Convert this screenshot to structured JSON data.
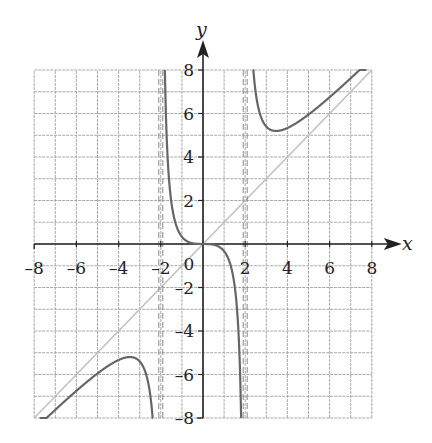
{
  "chart_data": {
    "type": "line",
    "title": "",
    "xlabel": "x",
    "ylabel": "y",
    "xlim": [
      -8,
      8
    ],
    "ylim": [
      -8,
      8
    ],
    "grid": true,
    "grid_step": 1,
    "x_ticks": [
      "-8",
      "-6",
      "-4",
      "-2",
      "0",
      "2",
      "4",
      "6",
      "8"
    ],
    "y_ticks": [
      "8",
      "6",
      "4",
      "2",
      "-2",
      "-4",
      "-6",
      "-8"
    ],
    "origin_label": "0",
    "series": [
      {
        "name": "f(x) = x^3/(x^2-4)",
        "style": "solid",
        "color": "#666666",
        "branches": [
          {
            "x": [
              -8,
              -6,
              -5,
              -4,
              -3.46,
              -3,
              -2.5,
              -2.2,
              -2.1
            ],
            "y": [
              -8.53,
              -6.75,
              -5.95,
              -5.33,
              -5.2,
              -5.4,
              -6.94,
              -12.68,
              -22.6
            ]
          },
          {
            "x": [
              -1.9,
              -1.7,
              -1.5,
              -1.2,
              -1,
              -0.5,
              0,
              0.5,
              1,
              1.2,
              1.5,
              1.7,
              1.9
            ],
            "y": [
              17.6,
              4.43,
              1.93,
              0.68,
              0.33,
              0.03,
              0,
              -0.03,
              -0.33,
              -0.68,
              -1.93,
              -4.43,
              -17.6
            ]
          },
          {
            "x": [
              2.1,
              2.2,
              2.5,
              3,
              3.46,
              4,
              5,
              6,
              8
            ],
            "y": [
              22.6,
              12.68,
              6.94,
              5.4,
              5.2,
              5.33,
              5.95,
              6.75,
              8.53
            ]
          }
        ]
      },
      {
        "name": "oblique asymptote y = x",
        "style": "solid-light",
        "color": "#bbbbbb",
        "x": [
          -8,
          8
        ],
        "y": [
          -8,
          8
        ]
      },
      {
        "name": "vertical asymptote x = -2",
        "style": "dashed",
        "color": "#888888",
        "x": [
          -2,
          -2
        ],
        "y": [
          -8,
          8
        ]
      },
      {
        "name": "vertical asymptote x = 2",
        "style": "dashed",
        "color": "#888888",
        "x": [
          2,
          2
        ],
        "y": [
          -8,
          8
        ]
      }
    ],
    "annotations": {
      "local_max": {
        "x": -3.46,
        "y": -5.2
      },
      "local_min": {
        "x": 3.46,
        "y": 5.2
      },
      "inflection": {
        "x": 0,
        "y": 0
      }
    }
  },
  "layout": {
    "origin_px": [
      203,
      244
    ],
    "x_unit_px": 21.1,
    "y_unit_px": 21.75,
    "colors": {
      "grid": "#a8a8a8",
      "axis": "#222222",
      "curve": "#666666",
      "asymptote_line": "#c0c0c0",
      "asymptote_dash": "#8a8a8a"
    }
  }
}
